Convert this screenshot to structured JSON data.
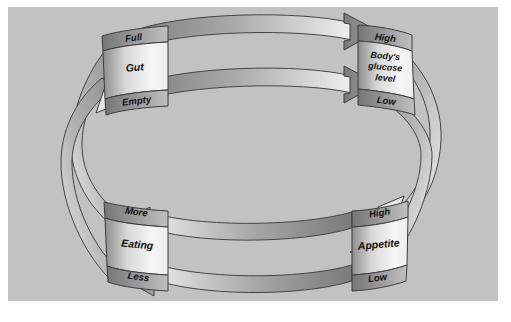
{
  "diagram": {
    "type": "cycle-diagram",
    "background_color": "#c2c2c2",
    "panel_border_color": "#ffffff",
    "band_fill_dark": "#8f8f8f",
    "band_fill_light": "#f2f2f2",
    "outline_color": "#3b3b3b",
    "nodes": [
      {
        "id": "gut",
        "position": "top-left",
        "top_label": "Full",
        "center_label": "Gut",
        "bottom_label": "Empty"
      },
      {
        "id": "glucose",
        "position": "top-right",
        "top_label": "High",
        "center_label": "Body's\nglucose\nlevel",
        "center_line_1": "Body's",
        "center_line_2": "glucose",
        "center_line_3": "level",
        "bottom_label": "Low"
      },
      {
        "id": "appetite",
        "position": "bottom-right",
        "top_label": "High",
        "center_label": "Appetite",
        "bottom_label": "Low"
      },
      {
        "id": "eating",
        "position": "bottom-left",
        "top_label": "More",
        "center_label": "Eating",
        "bottom_label": "Less"
      }
    ],
    "connections": [
      {
        "id": "full-to-high-glucose",
        "from": "gut",
        "to": "glucose",
        "side": "top",
        "ring": "outer",
        "direction": "right",
        "arrowhead": "dark"
      },
      {
        "id": "empty-to-low-glucose",
        "from": "gut",
        "to": "glucose",
        "side": "top",
        "ring": "inner",
        "direction": "right",
        "arrowhead": "dark"
      },
      {
        "id": "high-glucose-to-low-appetite",
        "from": "glucose",
        "to": "appetite",
        "side": "right",
        "ring": "outer",
        "direction": "down",
        "arrowhead": "light"
      },
      {
        "id": "low-glucose-to-high-appetite",
        "from": "glucose",
        "to": "appetite",
        "side": "right",
        "ring": "inner",
        "direction": "down",
        "arrowhead": "light"
      },
      {
        "id": "high-appetite-to-more-eating",
        "from": "appetite",
        "to": "eating",
        "side": "bottom",
        "ring": "outer",
        "direction": "left",
        "arrowhead": "dark"
      },
      {
        "id": "low-appetite-to-less-eating",
        "from": "appetite",
        "to": "eating",
        "side": "bottom",
        "ring": "inner",
        "direction": "left",
        "arrowhead": "dark"
      },
      {
        "id": "more-eating-to-full-gut",
        "from": "eating",
        "to": "gut",
        "side": "left",
        "ring": "outer",
        "direction": "up",
        "arrowhead": "light"
      },
      {
        "id": "less-eating-to-empty-gut",
        "from": "eating",
        "to": "gut",
        "side": "left",
        "ring": "inner",
        "direction": "up",
        "arrowhead": "light"
      }
    ]
  }
}
